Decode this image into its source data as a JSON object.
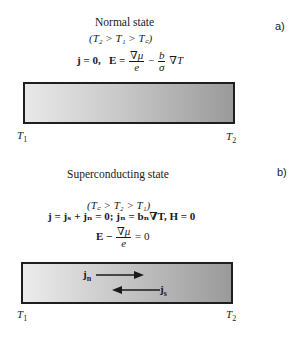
{
  "panel_a": {
    "tag": "a)",
    "title": "Normal state",
    "condition": "(T₂ > T₁ > T꜀)",
    "equation": {
      "j_part": "j = 0,",
      "E_lhs": "E =",
      "frac1_num": "∇μ",
      "frac1_den": "e",
      "minus": "−",
      "frac2_num": "b",
      "frac2_den": "σ",
      "tail": "∇T"
    },
    "left_label": "T",
    "left_sub": "1",
    "right_label": "T",
    "right_sub": "2",
    "bar_gradient": [
      "#e8e8e8",
      "#9a9a9a"
    ]
  },
  "panel_b": {
    "tag": "b)",
    "title": "Superconducting state",
    "condition": "(T꜀ > T₂ > T₁)",
    "equation1": "j = jₛ + jₙ = 0;  jₙ = bₙ∇T,  H = 0",
    "equation2": {
      "lhs": "E −",
      "frac_num": "∇μ",
      "frac_den": "e",
      "rhs": "= 0"
    },
    "arrow_normal_label": "j",
    "arrow_normal_sub": "n",
    "arrow_super_label": "j",
    "arrow_super_sub": "s",
    "left_label": "T",
    "left_sub": "1",
    "right_label": "T",
    "right_sub": "2",
    "bar_gradient": [
      "#ececec",
      "#9a9a9a"
    ]
  }
}
